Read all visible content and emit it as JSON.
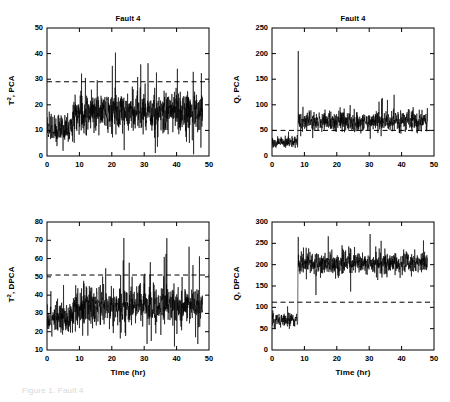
{
  "figure": {
    "width": 450,
    "height": 402,
    "background": "#ffffff",
    "line_color": "#000000",
    "threshold_color": "#000000",
    "caption_partial": "Figure 1. Fault 4"
  },
  "axis_label_x": "Time (hr)",
  "panels": [
    {
      "id": "t2-pca",
      "title": "Fault 4",
      "ylabel_main": "T",
      "ylabel_sup": "2",
      "ylabel_rest": ", PCA",
      "ylabel_full": "T2, PCA",
      "xlabel": "",
      "show_xlabel": false,
      "xlim": [
        0,
        50
      ],
      "ylim": [
        0,
        50
      ],
      "xticks": [
        0,
        10,
        20,
        30,
        40,
        50
      ],
      "yticks": [
        0,
        10,
        20,
        30,
        40,
        50
      ],
      "threshold": 29,
      "grid": false
    },
    {
      "id": "q-pca",
      "title": "Fault 4",
      "ylabel_main": "Q",
      "ylabel_sup": "",
      "ylabel_rest": ", PCA",
      "ylabel_full": "Q, PCA",
      "xlabel": "",
      "show_xlabel": false,
      "xlim": [
        0,
        50
      ],
      "ylim": [
        0,
        250
      ],
      "xticks": [
        0,
        10,
        20,
        30,
        40,
        50
      ],
      "yticks": [
        0,
        50,
        100,
        150,
        200,
        250
      ],
      "threshold": 50,
      "grid": false
    },
    {
      "id": "t2-dpca",
      "title": "",
      "ylabel_main": "T",
      "ylabel_sup": "2",
      "ylabel_rest": ", DPCA",
      "ylabel_full": "T2, DPCA",
      "xlabel": "Time (hr)",
      "show_xlabel": true,
      "xlim": [
        0,
        50
      ],
      "ylim": [
        10,
        80
      ],
      "xticks": [
        0,
        10,
        20,
        30,
        40,
        50
      ],
      "yticks": [
        10,
        20,
        30,
        40,
        50,
        60,
        70,
        80
      ],
      "threshold": 51,
      "grid": false
    },
    {
      "id": "q-dpca",
      "title": "",
      "ylabel_main": "Q",
      "ylabel_sup": "",
      "ylabel_rest": ", DPCA",
      "ylabel_full": "Q, DPCA",
      "xlabel": "Time (hr)",
      "show_xlabel": true,
      "xlim": [
        0,
        50
      ],
      "ylim": [
        0,
        300
      ],
      "xticks": [
        0,
        10,
        20,
        30,
        40,
        50
      ],
      "yticks": [
        0,
        50,
        100,
        150,
        200,
        250,
        300
      ],
      "threshold": 112,
      "grid": false
    }
  ],
  "chart_data": [
    {
      "type": "line",
      "id": "t2-pca",
      "title": "Fault 4",
      "xlabel": "",
      "ylabel": "T2, PCA",
      "xlim": [
        0,
        50
      ],
      "ylim": [
        0,
        50
      ],
      "xticks": [
        0,
        10,
        20,
        30,
        40,
        50
      ],
      "yticks": [
        0,
        10,
        20,
        30,
        40,
        50
      ],
      "grid": false,
      "legend": null,
      "annotations": [
        {
          "type": "hline",
          "label": "control limit",
          "value": 29,
          "style": "dashed"
        }
      ],
      "series": [
        {
          "name": "T2 statistic (PCA)",
          "x_start": 0,
          "x_end": 48,
          "n_points": 960,
          "fault_start_hr": 8,
          "segments": [
            {
              "x_from": 0,
              "x_to": 8,
              "mean": 11,
              "noise": 5.5,
              "spike_rate": 0.02,
              "spike_amp": 9
            },
            {
              "x_from": 8,
              "x_to": 48,
              "mean": 17,
              "noise": 7.0,
              "spike_rate": 0.05,
              "spike_amp": 16
            }
          ],
          "observed_min": 1,
          "observed_max": 43,
          "observed_mean_pre_fault": 11,
          "observed_mean_post_fault": 17
        }
      ]
    },
    {
      "type": "line",
      "id": "q-pca",
      "title": "Fault 4",
      "xlabel": "",
      "ylabel": "Q, PCA",
      "xlim": [
        0,
        50
      ],
      "ylim": [
        0,
        250
      ],
      "xticks": [
        0,
        10,
        20,
        30,
        40,
        50
      ],
      "yticks": [
        0,
        50,
        100,
        150,
        200,
        250
      ],
      "grid": false,
      "legend": null,
      "annotations": [
        {
          "type": "hline",
          "label": "control limit",
          "value": 50,
          "style": "dashed"
        },
        {
          "type": "point",
          "label": "onset spike",
          "x": 8.1,
          "y": 205
        }
      ],
      "series": [
        {
          "name": "Q statistic (PCA)",
          "x_start": 0,
          "x_end": 48,
          "n_points": 960,
          "fault_start_hr": 8,
          "segments": [
            {
              "x_from": 0,
              "x_to": 8,
              "mean": 28,
              "noise": 11,
              "spike_rate": 0.01,
              "spike_amp": 12
            },
            {
              "x_from": 8,
              "x_to": 48,
              "mean": 68,
              "noise": 17,
              "spike_rate": 0.05,
              "spike_amp": 28
            }
          ],
          "onset_spike": {
            "x": 8.1,
            "y": 205
          },
          "observed_min": 8,
          "observed_max": 205,
          "observed_mean_pre_fault": 28,
          "observed_mean_post_fault": 68
        }
      ]
    },
    {
      "type": "line",
      "id": "t2-dpca",
      "title": "",
      "xlabel": "Time (hr)",
      "ylabel": "T2, DPCA",
      "xlim": [
        0,
        50
      ],
      "ylim": [
        10,
        80
      ],
      "xticks": [
        0,
        10,
        20,
        30,
        40,
        50
      ],
      "yticks": [
        10,
        20,
        30,
        40,
        50,
        60,
        70,
        80
      ],
      "grid": false,
      "legend": null,
      "annotations": [
        {
          "type": "hline",
          "label": "control limit",
          "value": 51,
          "style": "dashed"
        }
      ],
      "series": [
        {
          "name": "T2 statistic (DPCA)",
          "x_start": 0,
          "x_end": 48,
          "n_points": 960,
          "fault_start_hr": 8,
          "segments": [
            {
              "x_from": 0,
              "x_to": 8,
              "mean": 27,
              "noise": 7.5,
              "spike_rate": 0.02,
              "spike_amp": 12
            },
            {
              "x_from": 8,
              "x_to": 48,
              "mean": 34,
              "noise": 9.5,
              "spike_rate": 0.05,
              "spike_amp": 22
            }
          ],
          "observed_min": 14,
          "observed_max": 70,
          "observed_mean_pre_fault": 27,
          "observed_mean_post_fault": 34
        }
      ]
    },
    {
      "type": "line",
      "id": "q-dpca",
      "title": "",
      "xlabel": "Time (hr)",
      "ylabel": "Q, DPCA",
      "xlim": [
        0,
        300
      ],
      "ylim": [
        0,
        300
      ],
      "xticks": [
        0,
        10,
        20,
        30,
        40,
        50
      ],
      "yticks": [
        0,
        50,
        100,
        150,
        200,
        250,
        300
      ],
      "grid": false,
      "legend": null,
      "annotations": [
        {
          "type": "hline",
          "label": "control limit",
          "value": 112,
          "style": "dashed"
        }
      ],
      "series": [
        {
          "name": "Q statistic (DPCA)",
          "x_start": 0,
          "x_end": 48,
          "n_points": 960,
          "fault_start_hr": 8,
          "segments": [
            {
              "x_from": 0,
              "x_to": 8,
              "mean": 70,
              "noise": 17,
              "spike_rate": 0.01,
              "spike_amp": 16
            },
            {
              "x_from": 8,
              "x_to": 48,
              "mean": 203,
              "noise": 22,
              "spike_rate": 0.04,
              "spike_amp": 40
            }
          ],
          "onset_spike": {
            "x": 8.1,
            "y": 265
          },
          "observed_min": 35,
          "observed_max": 265,
          "observed_mean_pre_fault": 70,
          "observed_mean_post_fault": 203
        }
      ]
    }
  ]
}
